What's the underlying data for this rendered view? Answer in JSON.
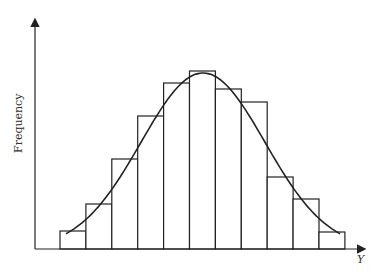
{
  "chart_data": {
    "type": "bar",
    "title": "",
    "xlabel": "Y",
    "ylabel": "Frequency",
    "grid": false,
    "legend": null,
    "categories": [
      "1",
      "2",
      "3",
      "4",
      "5",
      "6",
      "7",
      "8",
      "9",
      "10",
      "11"
    ],
    "values": [
      18,
      45,
      90,
      133,
      166,
      178,
      160,
      147,
      72,
      50,
      17
    ],
    "overlay_curve": {
      "type": "normal-density",
      "description": "smooth bell curve fitted over histogram"
    },
    "colors": {
      "bar_fill": "#ffffff",
      "stroke": "#222222",
      "background": "#ffffff"
    }
  },
  "axes": {
    "x_label": "Y",
    "y_label": "Frequency"
  }
}
